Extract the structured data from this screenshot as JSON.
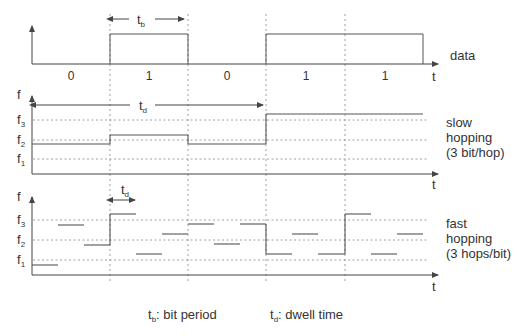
{
  "diagram": {
    "top_panel": {
      "label": "data",
      "axis_label": "t",
      "bits": [
        "0",
        "1",
        "0",
        "1",
        "1"
      ],
      "bit_period_label": "t",
      "bit_period_sub": "b"
    },
    "slow_panel": {
      "y_axis_label": "f",
      "x_axis_label": "t",
      "levels": [
        {
          "name": "f",
          "sub": "3"
        },
        {
          "name": "f",
          "sub": "2"
        },
        {
          "name": "f",
          "sub": "1"
        }
      ],
      "dwell_label": "t",
      "dwell_sub": "d",
      "title_lines": [
        "slow",
        "hopping",
        "(3 bit/hop)"
      ],
      "hop_levels": [
        "f2",
        "f3-",
        "f2",
        "f3+"
      ]
    },
    "fast_panel": {
      "y_axis_label": "f",
      "x_axis_label": "t",
      "levels": [
        {
          "name": "f",
          "sub": "3"
        },
        {
          "name": "f",
          "sub": "2"
        },
        {
          "name": "f",
          "sub": "1"
        }
      ],
      "dwell_label": "t",
      "dwell_sub": "d",
      "title_lines": [
        "fast",
        "hopping",
        "(3 hops/bit)"
      ]
    },
    "legend": {
      "bit_period": {
        "sym": "t",
        "sub": "b",
        "text": ": bit period"
      },
      "dwell_time": {
        "sym": "t",
        "sub": "d",
        "text": ": dwell time"
      }
    },
    "colors": {
      "line": "#555555",
      "dashed": "#777777",
      "text": "#333333"
    }
  }
}
